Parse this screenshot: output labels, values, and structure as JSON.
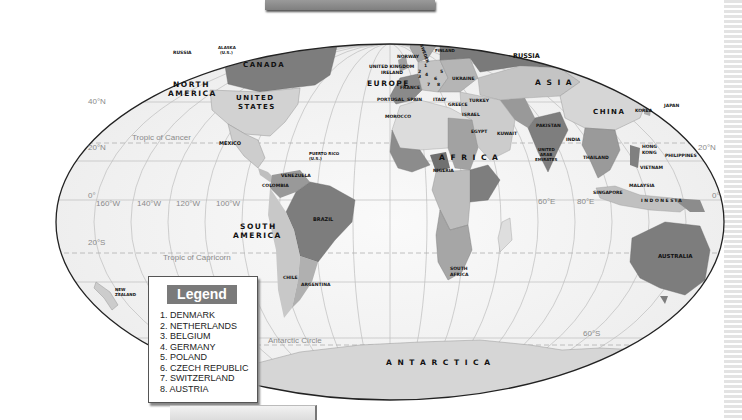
{
  "map": {
    "projection": "Mollweide",
    "continents": [
      "NORTH AMERICA",
      "SOUTH AMERICA",
      "EUROPE",
      "ASIA",
      "AFRICA",
      "AUSTRALIA",
      "ANTARCTICA"
    ],
    "labels": {
      "russia_west": "RUSSIA",
      "alaska_1": "ALASKA",
      "alaska_2": "(U.S.)",
      "canada": "CANADA",
      "north_america_1": "NORTH",
      "north_america_2": "AMERICA",
      "united_states_1": "UNITED",
      "united_states_2": "STATES",
      "mexico": "MEXICO",
      "puerto_rico_1": "PUERTO RICO",
      "puerto_rico_2": "(U.S.)",
      "venezuela": "VENEZUELA",
      "colombia": "COLOMBIA",
      "brazil": "BRAZIL",
      "south_america_1": "SOUTH",
      "south_america_2": "AMERICA",
      "chile": "CHILE",
      "argentina": "ARGENTINA",
      "new_zealand_1": "NEW",
      "new_zealand_2": "ZEALAND",
      "norway": "NORWAY",
      "sweden": "SWEDEN",
      "finland": "FINLAND",
      "united_kingdom": "UNITED KINGDOM",
      "ireland": "IRELAND",
      "europe": "EUROPE",
      "france": "FRANCE",
      "portugal": "PORTUGAL",
      "spain": "SPAIN",
      "italy": "ITALY",
      "greece": "GREECE",
      "ukraine": "UKRAINE",
      "turkey": "TURKEY",
      "israel": "ISRAEL",
      "morocco": "MOROCCO",
      "egypt": "EGYPT",
      "kuwait": "KUWAIT",
      "africa": "A F R I C A",
      "nigeria": "NIGERIA",
      "south_africa_1": "SOUTH",
      "south_africa_2": "AFRICA",
      "russia_east": "RUSSIA",
      "asia": "A S I A",
      "china": "CHINA",
      "korea": "KOREA",
      "japan": "JAPAN",
      "pakistan": "PAKISTAN",
      "india": "INDIA",
      "uae_1": "UNITED",
      "uae_2": "ARAB",
      "uae_3": "EMIRATES",
      "thailand": "THAILAND",
      "hong_kong_1": "HONG",
      "hong_kong_2": "KONG",
      "philippines": "PHILIPPINES",
      "vietnam": "VIETNAM",
      "malaysia": "MALAYSIA",
      "singapore": "SINGAPORE",
      "indonesia": "I N D O N E S I A",
      "australia": "AUSTRALIA",
      "antarctica": "A N T A R C T I C A",
      "europe_num_1": "1",
      "europe_num_2": "2",
      "europe_num_3": "3",
      "europe_num_4": "4",
      "europe_num_5": "5",
      "europe_num_6": "6",
      "europe_num_7": "7",
      "europe_num_8": "8"
    },
    "grid_labels": {
      "lat_40n": "40°N",
      "lat_20n_left": "20°N",
      "lat_20n_right": "20°N",
      "lat_0_left": "0°",
      "lat_0_right": "0°",
      "lat_20s": "20°S",
      "lat_60s": "60°S",
      "lon_160w": "160°W",
      "lon_140w": "140°W",
      "lon_120w": "120°W",
      "lon_100w": "100°W",
      "lon_60e": "60°E",
      "lon_80e": "80°E",
      "tropic_cancer": "Tropic of Cancer",
      "tropic_capricorn": "Tropic of Capricorn",
      "antarctic_circle": "Antarctic Circle"
    }
  },
  "legend": {
    "title": "Legend",
    "items": [
      "1. DENMARK",
      "2. NETHERLANDS",
      "3. BELGIUM",
      "4. GERMANY",
      "5. POLAND",
      "6. CZECH REPUBLIC",
      "7. SWITZERLAND",
      "8. AUSTRIA"
    ]
  },
  "colors": {
    "ocean": "#f4f4f4",
    "land_light": "#d9d9d9",
    "land_mid": "#a9a9a9",
    "land_dark": "#7a7a7a",
    "grid": "#b5b5b5",
    "legend_title_bg": "#7a7a7a"
  }
}
